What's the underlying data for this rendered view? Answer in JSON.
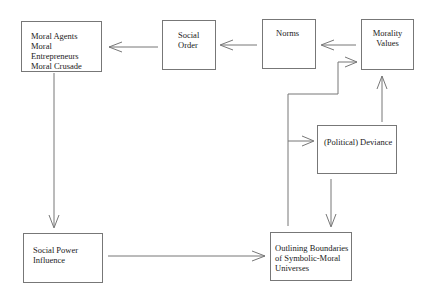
{
  "diagram": {
    "nodes": [
      {
        "id": "moral-agents",
        "label": "Moral Agents\nMoral Entrepreneurs\nMoral Crusade"
      },
      {
        "id": "social-order",
        "label": "Social\nOrder"
      },
      {
        "id": "norms",
        "label": "Norms"
      },
      {
        "id": "morality-values",
        "label": "Morality\nValues"
      },
      {
        "id": "political-deviance",
        "label": "(Political) Deviance"
      },
      {
        "id": "social-power",
        "label": "Social Power\nInfluence"
      },
      {
        "id": "outlining-boundaries",
        "label": "Outlining Boundaries\nof Symbolic-Moral\nUniverses"
      }
    ],
    "edges": [
      {
        "from": "morality-values",
        "to": "norms"
      },
      {
        "from": "norms",
        "to": "social-order"
      },
      {
        "from": "social-order",
        "to": "moral-agents"
      },
      {
        "from": "moral-agents",
        "to": "social-power"
      },
      {
        "from": "social-power",
        "to": "outlining-boundaries"
      },
      {
        "from": "outlining-boundaries",
        "to": "morality-values"
      },
      {
        "from": "outlining-boundaries",
        "to": "political-deviance"
      },
      {
        "from": "political-deviance",
        "to": "morality-values"
      },
      {
        "from": "political-deviance",
        "to": "outlining-boundaries"
      }
    ]
  }
}
